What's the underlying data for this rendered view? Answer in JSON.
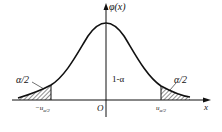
{
  "diagram": {
    "type": "normal-distribution-two-tailed",
    "y_axis_label": "φ(x)",
    "x_axis_label": "x",
    "origin_label": "O",
    "center_area_label": "1-α",
    "left_tail_label": "α/2",
    "right_tail_label": "α/2",
    "left_cutoff": {
      "sign": "−",
      "main": "u",
      "sub": "α/2"
    },
    "right_cutoff": {
      "sign": "",
      "main": "u",
      "sub": "α/2"
    },
    "colors": {
      "line": "#111111",
      "hatch": "#222222",
      "background": "#ffffff"
    }
  }
}
